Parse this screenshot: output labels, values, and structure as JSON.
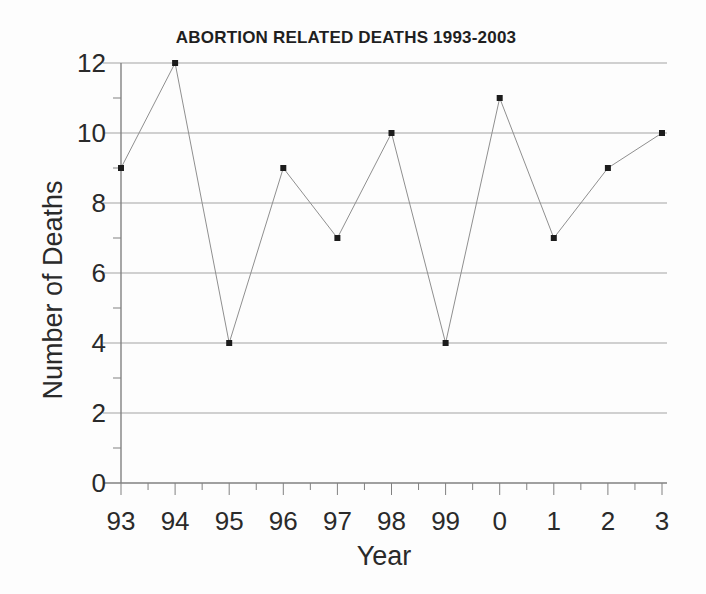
{
  "chart_data": {
    "type": "line",
    "title": "ABORTION RELATED DEATHS 1993-2003",
    "xlabel": "Year",
    "ylabel": "Number of Deaths",
    "categories": [
      "93",
      "94",
      "95",
      "96",
      "97",
      "98",
      "99",
      "0",
      "1",
      "2",
      "3"
    ],
    "series": [
      {
        "name": "Abortion related deaths",
        "values": [
          9,
          12,
          4,
          9,
          7,
          10,
          4,
          11,
          7,
          9,
          10
        ]
      }
    ],
    "ylim": [
      0,
      12
    ],
    "ytick_step": 2,
    "ytick_labels": [
      "0",
      "2",
      "4",
      "6",
      "8",
      "10",
      "12"
    ],
    "y_minor_tick_step": 1,
    "grid": "horizontal-major",
    "legend": "none",
    "marker": "filled-square",
    "colors": {
      "background": "#fdfdfd",
      "text": "#2a2a2a",
      "grid": "#a3a3a3",
      "axis": "#818181",
      "line": "#8f8f8f",
      "marker": "#1c1c1c"
    }
  }
}
